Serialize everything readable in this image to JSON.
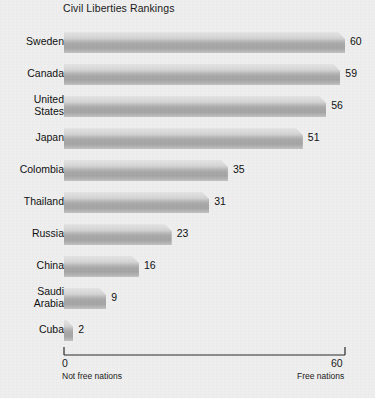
{
  "chart_data": {
    "type": "bar",
    "orientation": "horizontal",
    "title": "Civil Liberties Rankings",
    "xlabel": "",
    "ylabel": "",
    "xlim": [
      0,
      60
    ],
    "grid": false,
    "legend": null,
    "categories": [
      "Sweden",
      "Canada",
      "United\nStates",
      "Japan",
      "Colombia",
      "Thailand",
      "Russia",
      "China",
      "Saudi\nArabia",
      "Cuba"
    ],
    "values": [
      60,
      59,
      56,
      51,
      35,
      31,
      23,
      16,
      9,
      2
    ],
    "value_labels": [
      "60",
      "59",
      "56",
      "51",
      "35",
      "31",
      "23",
      "16",
      "9",
      "2"
    ],
    "axis": {
      "min_tick_label": "0",
      "max_tick_label": "60",
      "left_caption": "Not free nations",
      "right_caption": "Free nations"
    },
    "colors": {
      "background": "#eeeeee",
      "bar_light": "#e4e4e4",
      "bar_mid": "#b8b8b8",
      "bar_dark": "#a5a5a5",
      "text": "#111111",
      "axis_line": "#2b2b2b"
    }
  }
}
